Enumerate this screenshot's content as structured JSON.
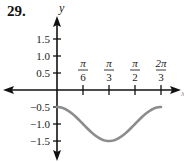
{
  "problem_number": "29.",
  "chart_data": {
    "type": "line",
    "title": "",
    "xlabel": "x",
    "ylabel": "y",
    "function": "y = -1 + 0.5*cos(3x)",
    "x_ticks": [
      {
        "value": 0.5235987756,
        "num": "π",
        "den": "6"
      },
      {
        "value": 1.0471975512,
        "num": "π",
        "den": "3"
      },
      {
        "value": 1.5707963268,
        "num": "π",
        "den": "2"
      },
      {
        "value": 2.0943951024,
        "num": "2π",
        "den": "3"
      }
    ],
    "y_ticks": [
      {
        "value": 1.5,
        "label": "1.5"
      },
      {
        "value": 1.0,
        "label": "1.0"
      },
      {
        "value": 0.5,
        "label": "0.5"
      },
      {
        "value": -0.5,
        "label": "−0.5"
      },
      {
        "value": -1.0,
        "label": "−1.0"
      },
      {
        "value": -1.5,
        "label": "−1.5"
      }
    ],
    "x_domain": [
      0,
      2.0943951024
    ],
    "ylim": [
      -1.9,
      1.95
    ],
    "series": [
      {
        "name": "curve",
        "color": "#8c8c8c",
        "x": [
          0,
          0.2618,
          0.5236,
          0.7854,
          1.0472,
          1.309,
          1.5708,
          1.8326,
          2.0944
        ],
        "y": [
          -0.5,
          -0.646,
          -1.0,
          -1.354,
          -1.5,
          -1.354,
          -1.0,
          -0.646,
          -0.5
        ]
      }
    ],
    "grid": false,
    "axis_color": "#111111"
  }
}
